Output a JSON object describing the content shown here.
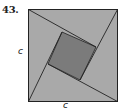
{
  "problem": {
    "number": "43."
  },
  "labels": {
    "left_side": "c",
    "bottom_side": "c"
  },
  "figure": {
    "colors": {
      "outer_fill": "#a9a9a9",
      "inner_square_fill": "#7b7b7b",
      "stroke": "#222222"
    },
    "outer_square": {
      "x1": 28.5,
      "y1": 9.5,
      "x2": 117.5,
      "y2": 101.5
    },
    "inner_square": [
      [
        62,
        32
      ],
      [
        96,
        47
      ],
      [
        80,
        80
      ],
      [
        48,
        64
      ]
    ],
    "lines": [
      [
        [
          28.5,
          9.5
        ],
        [
          96,
          47
        ]
      ],
      [
        [
          117.5,
          9.5
        ],
        [
          80,
          80
        ]
      ],
      [
        [
          117.5,
          101.5
        ],
        [
          48,
          64
        ]
      ],
      [
        [
          28.5,
          101.5
        ],
        [
          62,
          32
        ]
      ]
    ]
  }
}
